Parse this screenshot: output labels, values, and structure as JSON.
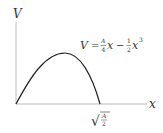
{
  "diagram": {
    "type": "function-plot",
    "y_axis_label": "V",
    "x_axis_label": "x",
    "equation": {
      "lhs": "V",
      "equals": "=",
      "term1_num": "A",
      "term1_den": "4",
      "term1_var": "x",
      "minus": "−",
      "term2_num": "1",
      "term2_den": "2",
      "term2_var": "x",
      "term2_exp": "3"
    },
    "root_label": {
      "radical": "√",
      "num": "A",
      "den": "2"
    },
    "colors": {
      "axis": "#bbbbbb",
      "curve": "#222222",
      "text": "#333333"
    }
  }
}
